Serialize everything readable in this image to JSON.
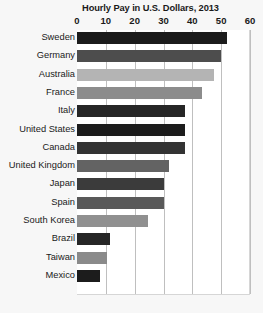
{
  "chart_data": {
    "type": "bar",
    "orientation": "horizontal",
    "title": "Hourly Pay in U.S. Dollars, 2013",
    "xlabel": "",
    "ylabel": "",
    "xlim": [
      0,
      60
    ],
    "xticks": [
      0,
      10,
      20,
      30,
      40,
      50,
      60
    ],
    "xtick_labels": [
      "0",
      "10",
      "20",
      "30",
      "40",
      "50",
      "60"
    ],
    "grid": "vertical",
    "legend": "none",
    "categories": [
      "Sweden",
      "Germany",
      "Australia",
      "France",
      "Italy",
      "United States",
      "Canada",
      "United Kingdom",
      "Japan",
      "Spain",
      "South Korea",
      "Brazil",
      "Taiwan",
      "Mexico"
    ],
    "values": [
      52,
      50,
      47.5,
      43.5,
      37.5,
      37.5,
      37.5,
      32,
      30,
      30,
      24.5,
      11.5,
      10.5,
      8
    ],
    "bar_colors": [
      "#1c1c1c",
      "#4d4d4d",
      "#b4b4b4",
      "#8c8c8c",
      "#262626",
      "#1c1c1c",
      "#333333",
      "#636363",
      "#3b3b3b",
      "#595959",
      "#909090",
      "#262626",
      "#8a8a8a",
      "#1c1c1c"
    ],
    "series": [
      {
        "name": "Hourly Pay",
        "points": [
          {
            "category": "Sweden",
            "value": 52,
            "color": "#1c1c1c"
          },
          {
            "category": "Germany",
            "value": 50,
            "color": "#4d4d4d"
          },
          {
            "category": "Australia",
            "value": 47.5,
            "color": "#b4b4b4"
          },
          {
            "category": "France",
            "value": 43.5,
            "color": "#8c8c8c"
          },
          {
            "category": "Italy",
            "value": 37.5,
            "color": "#262626"
          },
          {
            "category": "United States",
            "value": 37.5,
            "color": "#1c1c1c"
          },
          {
            "category": "Canada",
            "value": 37.5,
            "color": "#333333"
          },
          {
            "category": "United Kingdom",
            "value": 32,
            "color": "#636363"
          },
          {
            "category": "Japan",
            "value": 30,
            "color": "#3b3b3b"
          },
          {
            "category": "Spain",
            "value": 30,
            "color": "#595959"
          },
          {
            "category": "South Korea",
            "value": 24.5,
            "color": "#909090"
          },
          {
            "category": "Brazil",
            "value": 11.5,
            "color": "#262626"
          },
          {
            "category": "Taiwan",
            "value": 10.5,
            "color": "#8a8a8a"
          },
          {
            "category": "Mexico",
            "value": 8,
            "color": "#1c1c1c"
          }
        ]
      }
    ]
  }
}
